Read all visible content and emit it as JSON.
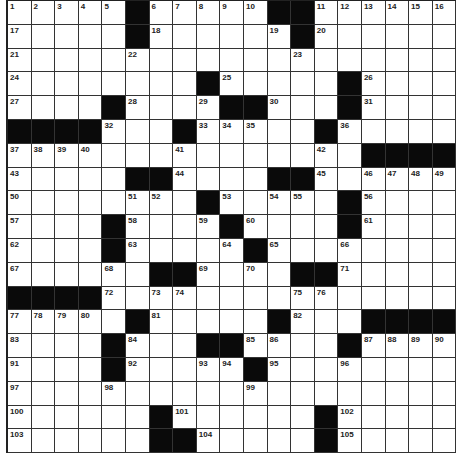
{
  "puzzle": {
    "rows": 19,
    "cols": 19,
    "colors": {
      "block": "#0a0a0a",
      "cell": "#ffffff",
      "line": "#333333"
    },
    "grid": [
      "1,2,3,4,5,#,6,7,8,9,10,#,#,11,12,13,14,15,16",
      "17,.,.,.,.,#,18,.,.,.,.,19,#,20,.,.,.,.,.",
      "21,.,.,.,.,22,.,.,.,.,.,.,23,.,.,.,.,.,.",
      "24,.,.,.,.,.,.,.,#,25,.,.,.,.,#,26,.,.,.",
      "27,.,.,.,#,28,.,.,29,#,#,30,.,.,#,31,.,.,.",
      "#,#,#,#,32,.,.,#,33,34,35,.,.,#,36,.,.,.,.",
      "37,38,39,40,.,.,.,41,.,.,.,.,.,42,.,#,#,#,#",
      "43,.,.,.,.,#,#,44,.,.,.,#,#,45,.,46,47,48,49",
      "50,.,.,.,.,51,52,.,#,53,.,54,55,.,#,56,.,.,.",
      "57,.,.,.,#,58,.,.,59,#,60,.,.,.,#,61,.,.,.",
      "62,.,.,.,#,63,.,.,.,64,#,65,.,.,66,.,.,.,.",
      "67,.,.,.,68,.,#,#,69,.,70,.,#,#,71,.,.,.,.",
      "#,#,#,#,72,.,73,74,.,.,.,.,75,76,.,.,.,.,.",
      "77,78,79,80,.,#,81,.,.,.,.,#,82,.,.,#,#,#,#",
      "83,.,.,.,#,84,.,.,#,#,85,86,.,.,#,87,88,89,90",
      "91,.,.,.,#,92,.,.,93,94,#,95,.,.,96,.,.,.,.",
      "97,.,.,.,98,.,.,.,.,.,99,.,.,.,.,.,.,.,.",
      "100,.,.,.,.,.,#,101,.,.,.,.,.,#,102,.,.,.,.",
      "103,.,.,.,.,.,#,#,104,.,.,.,.,#,105,.,.,.,."
    ]
  }
}
